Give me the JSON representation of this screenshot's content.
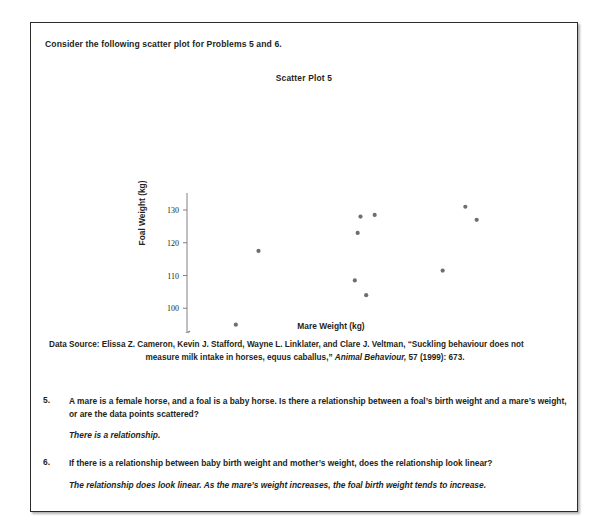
{
  "page": {
    "intro": "Consider the following scatter plot for Problems 5 and 6."
  },
  "chart_data": {
    "type": "scatter",
    "title": "Scatter Plot 5",
    "xlabel": "Mare Weight (kg)",
    "ylabel": "Foal Weight (kg)",
    "xlim": [
      500,
      595
    ],
    "ylim": [
      88,
      132
    ],
    "x_ticks": [
      "0",
      "500",
      "510",
      "520",
      "530",
      "540",
      "550",
      "560",
      "570",
      "580",
      "590"
    ],
    "y_ticks": [
      "0",
      "90",
      "100",
      "110",
      "120",
      "130"
    ],
    "axis_break_x": true,
    "axis_break_y": true,
    "grid": false,
    "legend": "none",
    "marker_color": "#6d6e71",
    "points": [
      {
        "x": 507,
        "y": 95
      },
      {
        "x": 515,
        "y": 117.5
      },
      {
        "x": 549,
        "y": 108.5
      },
      {
        "x": 550,
        "y": 123
      },
      {
        "x": 551,
        "y": 128
      },
      {
        "x": 553,
        "y": 104
      },
      {
        "x": 556,
        "y": 128.5
      },
      {
        "x": 580,
        "y": 111.5
      },
      {
        "x": 588,
        "y": 131
      },
      {
        "x": 592,
        "y": 127
      }
    ]
  },
  "source": {
    "lead": "Data Source:  Elissa Z. Cameron, Kevin J. Stafford, Wayne L. Linklater, and Clare J. Veltman, “Suckling behaviour does not",
    "line2_a": "measure milk intake in horses, equus caballus,” ",
    "line2_italic": "Animal Behaviour,",
    "line2_b": " 57 (1999): 673."
  },
  "problems": [
    {
      "number": "5.",
      "question": "A mare is a female horse, and a foal is a baby horse.  Is there a relationship between a foal’s birth weight and a mare’s weight, or are the data points scattered?",
      "answer": "There is a relationship."
    },
    {
      "number": "6.",
      "question": "If there is a relationship between baby birth weight and mother’s weight, does the relationship look linear?",
      "answer": "The relationship does look linear.  As the mare’s weight increases, the foal birth weight tends to increase."
    }
  ]
}
